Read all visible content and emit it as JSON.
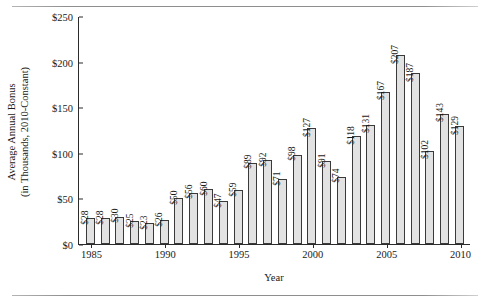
{
  "chart_data": {
    "type": "bar",
    "title": "",
    "xlabel": "Year",
    "ylabel_line1": "Average Annual Bonus",
    "ylabel_line2": "(in Thousands, 2010-Constant)",
    "categories": [
      1985,
      1986,
      1987,
      1988,
      1989,
      1990,
      1991,
      1992,
      1993,
      1994,
      1995,
      1996,
      1997,
      1998,
      1999,
      2000,
      2001,
      2002,
      2003,
      2004,
      2005,
      2006,
      2007,
      2008,
      2009,
      2010
    ],
    "values": [
      28,
      28,
      30,
      25,
      23,
      26,
      50,
      56,
      60,
      47,
      59,
      89,
      92,
      71,
      98,
      127,
      91,
      74,
      118,
      131,
      167,
      207,
      187,
      102,
      143,
      129
    ],
    "bar_labels": [
      "$28",
      "$28",
      "$30",
      "$25",
      "$23",
      "$26",
      "$50",
      "$56",
      "$60",
      "$47",
      "$59",
      "$89",
      "$92",
      "$71",
      "$98",
      "$127",
      "$91",
      "$74",
      "$118",
      "$131",
      "$167",
      "$207",
      "$187",
      "$102",
      "$143",
      "$129"
    ],
    "ylim": [
      0,
      250
    ],
    "yticks": [
      0,
      50,
      100,
      150,
      200,
      250
    ],
    "ytick_labels": [
      "$0",
      "$50",
      "$100",
      "$150",
      "$200",
      "$250"
    ],
    "xticks": [
      1985,
      1990,
      1995,
      2000,
      2005,
      2010
    ],
    "xtick_labels": [
      "1985",
      "1990",
      "1995",
      "2000",
      "2005",
      "2010"
    ],
    "grid": false,
    "legend": false,
    "bar_fill_color": "#e2e2e2",
    "bar_edge_color": "#3a3a3a",
    "axis_color": "#2b2b2b"
  }
}
